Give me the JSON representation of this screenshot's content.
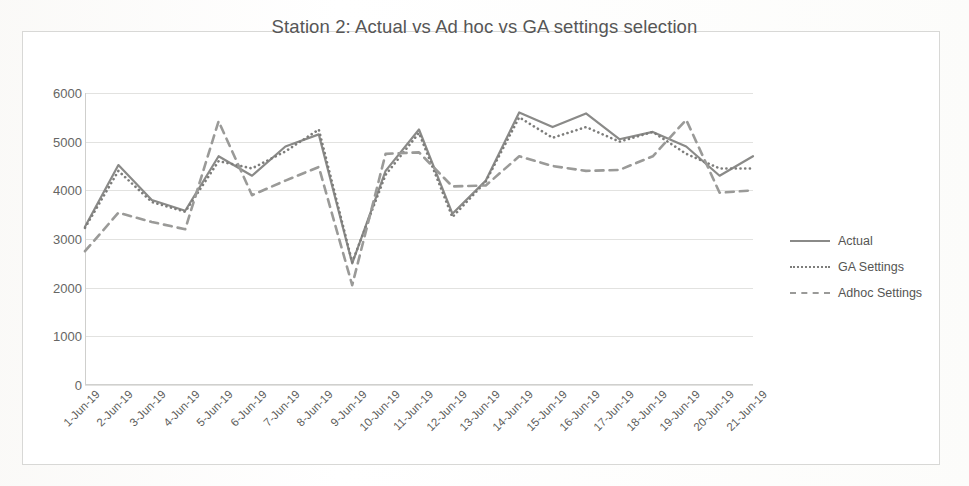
{
  "chart_data": {
    "type": "line",
    "title": "Station 2: Actual vs Ad hoc vs GA settings selection",
    "xlabel": "",
    "ylabel": "",
    "ylim": [
      0,
      6000
    ],
    "ytick_values": [
      6000,
      5000,
      4000,
      3000,
      2000,
      1000,
      0
    ],
    "ytick_labels": [
      "6000",
      "5000",
      "4000",
      "3000",
      "2000",
      "1000",
      "0"
    ],
    "grid": true,
    "legend_position": "right",
    "categories": [
      "1-Jun-19",
      "2-Jun-19",
      "3-Jun-19",
      "4-Jun-19",
      "5-Jun-19",
      "6-Jun-19",
      "7-Jun-19",
      "8-Jun-19",
      "9-Jun-19",
      "10-Jun-19",
      "11-Jun-19",
      "12-Jun-19",
      "13-Jun-19",
      "14-Jun-19",
      "15-Jun-19",
      "16-Jun-19",
      "17-Jun-19",
      "18-Jun-19",
      "19-Jun-19",
      "20-Jun-19",
      "21-Jun-19"
    ],
    "series": [
      {
        "name": "Actual",
        "style": "solid",
        "color": "#8a8a88",
        "values": [
          3250,
          4520,
          3800,
          3580,
          4700,
          4300,
          4900,
          5150,
          2500,
          4400,
          5250,
          3520,
          4200,
          5600,
          5300,
          5580,
          5050,
          5200,
          4900,
          4300,
          4700
        ]
      },
      {
        "name": "GA Settings",
        "style": "dotted",
        "color": "#7d7d7b",
        "values": [
          3230,
          4400,
          3760,
          3560,
          4600,
          4450,
          4800,
          5250,
          2520,
          4320,
          5180,
          3450,
          4180,
          5500,
          5080,
          5300,
          5000,
          5200,
          4750,
          4450,
          4450
        ]
      },
      {
        "name": "Adhoc Settings",
        "style": "dashed",
        "color": "#9a9a98",
        "values": [
          2750,
          3540,
          3350,
          3200,
          5420,
          3900,
          4200,
          4480,
          2050,
          4750,
          4780,
          4080,
          4100,
          4700,
          4500,
          4400,
          4420,
          4700,
          5450,
          3950,
          4000
        ]
      }
    ]
  },
  "legend": {
    "items": [
      {
        "label": "Actual"
      },
      {
        "label": "GA Settings"
      },
      {
        "label": "Adhoc Settings"
      }
    ]
  }
}
